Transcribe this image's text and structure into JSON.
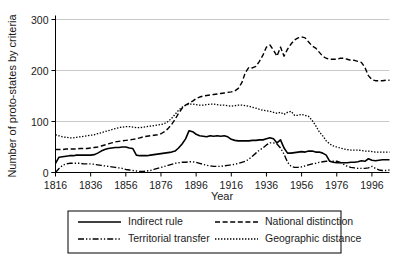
{
  "chart_data": {
    "type": "line",
    "title": "",
    "xlabel": "Year",
    "ylabel": "Number of proto-states by criteria",
    "xlim": [
      1816,
      2006
    ],
    "ylim": [
      0,
      300
    ],
    "yticks": [
      0,
      100,
      200,
      300
    ],
    "xticks": [
      1816,
      1836,
      1856,
      1876,
      1896,
      1916,
      1936,
      1956,
      1976,
      1996
    ],
    "grid": "horizontal",
    "legend_position": "below-plot",
    "x": [
      1816,
      1818,
      1820,
      1822,
      1824,
      1826,
      1828,
      1830,
      1832,
      1834,
      1836,
      1838,
      1840,
      1842,
      1844,
      1846,
      1848,
      1850,
      1852,
      1854,
      1856,
      1858,
      1860,
      1862,
      1864,
      1866,
      1868,
      1870,
      1872,
      1874,
      1876,
      1878,
      1880,
      1882,
      1884,
      1886,
      1888,
      1890,
      1892,
      1894,
      1896,
      1898,
      1900,
      1902,
      1904,
      1906,
      1908,
      1910,
      1912,
      1914,
      1916,
      1918,
      1920,
      1922,
      1924,
      1926,
      1928,
      1930,
      1932,
      1934,
      1936,
      1938,
      1940,
      1942,
      1944,
      1946,
      1948,
      1950,
      1952,
      1954,
      1956,
      1958,
      1960,
      1962,
      1964,
      1966,
      1968,
      1970,
      1972,
      1974,
      1976,
      1978,
      1980,
      1982,
      1984,
      1986,
      1988,
      1990,
      1992,
      1994,
      1996,
      1998,
      2000,
      2002,
      2004,
      2006
    ],
    "series": [
      {
        "name": "Indirect rule",
        "style": "solid",
        "values": [
          18,
          30,
          31,
          32,
          33,
          33,
          34,
          34,
          34,
          34,
          34,
          35,
          38,
          42,
          45,
          47,
          48,
          49,
          49,
          50,
          50,
          48,
          47,
          34,
          33,
          33,
          33,
          34,
          35,
          36,
          37,
          38,
          39,
          40,
          42,
          48,
          56,
          66,
          82,
          80,
          75,
          72,
          71,
          70,
          72,
          71,
          72,
          71,
          72,
          70,
          65,
          63,
          62,
          62,
          62,
          62,
          63,
          63,
          64,
          64,
          66,
          68,
          66,
          58,
          64,
          48,
          38,
          38,
          39,
          40,
          41,
          40,
          42,
          42,
          40,
          40,
          38,
          34,
          22,
          20,
          19,
          19,
          19,
          19,
          20,
          20,
          21,
          23,
          22,
          27,
          24,
          23,
          24,
          25,
          25,
          25
        ]
      },
      {
        "name": "National distinction",
        "style": "dashed",
        "values": [
          45,
          45,
          45,
          46,
          46,
          46,
          46,
          47,
          47,
          47,
          48,
          49,
          50,
          52,
          54,
          56,
          58,
          60,
          61,
          62,
          63,
          64,
          65,
          66,
          68,
          70,
          71,
          72,
          73,
          74,
          76,
          80,
          86,
          94,
          104,
          116,
          126,
          132,
          136,
          140,
          145,
          148,
          150,
          151,
          152,
          153,
          154,
          155,
          156,
          157,
          158,
          160,
          165,
          176,
          196,
          206,
          205,
          208,
          218,
          230,
          246,
          250,
          240,
          228,
          246,
          228,
          242,
          252,
          260,
          264,
          266,
          264,
          256,
          248,
          244,
          236,
          228,
          224,
          222,
          222,
          222,
          224,
          224,
          222,
          220,
          220,
          218,
          216,
          206,
          190,
          182,
          180,
          180,
          180,
          181,
          181
        ]
      },
      {
        "name": "Territorial transfer",
        "style": "dash-dot",
        "values": [
          0,
          8,
          14,
          17,
          18,
          18,
          18,
          18,
          17,
          17,
          17,
          16,
          15,
          14,
          13,
          12,
          11,
          10,
          9,
          8,
          6,
          5,
          4,
          3,
          2,
          2,
          3,
          4,
          6,
          8,
          10,
          12,
          14,
          16,
          18,
          19,
          20,
          20,
          21,
          21,
          20,
          18,
          16,
          14,
          13,
          12,
          12,
          12,
          13,
          14,
          15,
          16,
          18,
          20,
          22,
          26,
          32,
          38,
          44,
          48,
          54,
          58,
          58,
          56,
          48,
          36,
          20,
          12,
          10,
          10,
          11,
          13,
          15,
          17,
          18,
          20,
          21,
          22,
          22,
          22,
          22,
          20,
          16,
          12,
          10,
          9,
          8,
          8,
          8,
          9,
          12,
          8,
          5,
          4,
          4,
          5
        ]
      },
      {
        "name": "Geographic distance",
        "style": "dotted",
        "values": [
          74,
          72,
          70,
          69,
          68,
          68,
          69,
          70,
          71,
          72,
          73,
          74,
          76,
          78,
          80,
          82,
          84,
          86,
          88,
          89,
          90,
          90,
          89,
          88,
          88,
          89,
          90,
          91,
          92,
          93,
          94,
          96,
          100,
          106,
          114,
          122,
          128,
          132,
          134,
          134,
          133,
          132,
          132,
          133,
          134,
          134,
          133,
          132,
          132,
          131,
          130,
          131,
          132,
          132,
          131,
          130,
          128,
          126,
          124,
          122,
          121,
          120,
          118,
          116,
          118,
          114,
          118,
          120,
          112,
          112,
          114,
          112,
          110,
          102,
          92,
          80,
          72,
          62,
          56,
          52,
          50,
          48,
          46,
          45,
          44,
          44,
          44,
          43,
          42,
          42,
          41,
          40,
          40,
          40,
          40,
          40
        ]
      }
    ]
  },
  "legend": {
    "items": [
      {
        "label": "Indirect rule",
        "style": "solid"
      },
      {
        "label": "National distinction",
        "style": "dashed"
      },
      {
        "label": "Territorial transfer",
        "style": "dash-dot"
      },
      {
        "label": "Geographic distance",
        "style": "dotted"
      }
    ]
  }
}
